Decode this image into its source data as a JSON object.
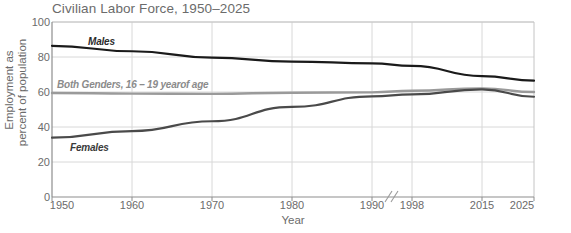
{
  "chart_data": {
    "type": "line",
    "title": "Civilian Labor Force, 1950–2025",
    "xlabel": "Year",
    "ylabel_line1": "Employment as",
    "ylabel_line2": "percent of population",
    "x": [
      1950,
      1960,
      1970,
      1980,
      1990,
      1998,
      2015,
      2025
    ],
    "xtick_labels": [
      "1950",
      "1960",
      "1970",
      "1980",
      "1990",
      "1998",
      "2015",
      "2025"
    ],
    "axis_break": {
      "present": true,
      "between": [
        "1990",
        "1998"
      ],
      "symbol": "//"
    },
    "ytick_labels": [
      "0",
      "20",
      "40",
      "60",
      "80",
      "100"
    ],
    "yticks": [
      0,
      20,
      40,
      60,
      80,
      100
    ],
    "ylim": [
      0,
      100
    ],
    "grid": true,
    "legend_position": "inline-labels",
    "series": [
      {
        "name": "Males",
        "label": "Males",
        "color": "#1a1a1a",
        "values": [
          86.4,
          83.3,
          79.7,
          77.4,
          76.4,
          74.9,
          69.1,
          66.5
        ]
      },
      {
        "name": "Both Genders, 16 - 19 year of age",
        "label": "Both Genders, 16 – 19 yearof age",
        "color": "#9a9a9a",
        "values": [
          59.4,
          59.1,
          58.9,
          59.6,
          59.8,
          60.7,
          62.1,
          60.0
        ]
      },
      {
        "name": "Females",
        "label": "Females",
        "color": "#4a4a4a",
        "values": [
          33.9,
          37.7,
          43.3,
          51.5,
          57.5,
          58.6,
          61.5,
          57.3
        ]
      }
    ]
  }
}
